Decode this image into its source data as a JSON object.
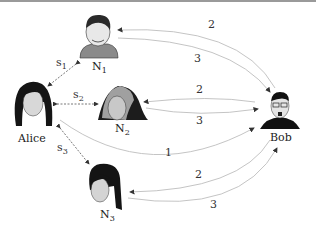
{
  "nodes": {
    "alice": {
      "label": "Alice"
    },
    "bob": {
      "label": "Bob"
    },
    "n1": {
      "label": "N",
      "sub": "1"
    },
    "n2": {
      "label": "N",
      "sub": "2"
    },
    "n3": {
      "label": "N",
      "sub": "3"
    }
  },
  "side_links": [
    {
      "label": "s",
      "sub": "1",
      "from": "Alice",
      "to": "N1"
    },
    {
      "label": "s",
      "sub": "2",
      "from": "Alice",
      "to": "N2"
    },
    {
      "label": "s",
      "sub": "3",
      "from": "Alice",
      "to": "N3"
    }
  ],
  "edges": [
    {
      "from": "Bob",
      "to": "N1",
      "label": "2"
    },
    {
      "from": "N1",
      "to": "Bob",
      "label": "3"
    },
    {
      "from": "Bob",
      "to": "N2",
      "label": "2"
    },
    {
      "from": "N2",
      "to": "Bob",
      "label": "3"
    },
    {
      "from": "Alice",
      "to": "Bob",
      "label": "1"
    },
    {
      "from": "Bob",
      "to": "N3",
      "label": "2"
    },
    {
      "from": "N3",
      "to": "Bob",
      "label": "3"
    }
  ],
  "colors": {
    "edge": "#bdbdbd",
    "dashed": "#555555",
    "text": "#333333"
  }
}
